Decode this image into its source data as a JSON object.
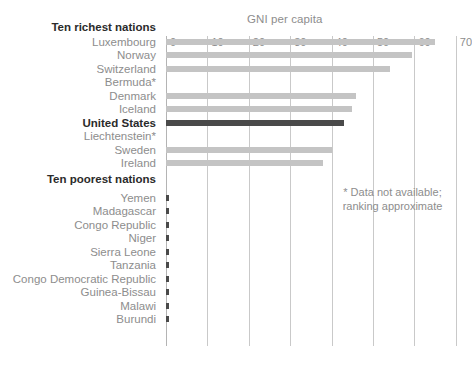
{
  "chart_data": {
    "type": "bar",
    "title": "GNI per capita",
    "xlabel": "",
    "ylabel": "",
    "orientation": "horizontal",
    "xlim": [
      0,
      70
    ],
    "xticks": [
      0,
      10,
      20,
      30,
      40,
      50,
      60,
      70
    ],
    "xtick_labels": [
      "0",
      "10",
      "20",
      "30",
      "40",
      "50",
      "60",
      "70"
    ],
    "grid": true,
    "legend": "none",
    "group_headings": [
      "Ten richest nations",
      "Ten poorest nations"
    ],
    "highlight_category": "United States",
    "annotation": "* Data not available; ranking approximate",
    "annotation_lines": [
      "* Data not available;",
      "ranking approximate"
    ],
    "categories": [
      "Luxembourg",
      "Norway",
      "Switzerland",
      "Bermuda*",
      "Denmark",
      "Iceland",
      "United States",
      "Liechtenstein*",
      "Sweden",
      "Ireland",
      "Yemen",
      "Madagascar",
      "Congo Republic",
      "Niger",
      "Sierra Leone",
      "Tanzania",
      "Congo Democratic Republic",
      "Guinea-Bissau",
      "Malawi",
      "Burundi"
    ],
    "values": [
      65,
      59.5,
      54,
      null,
      46,
      45,
      43,
      null,
      40,
      38,
      0.9,
      0.9,
      0.9,
      0.9,
      0.9,
      0.9,
      0.9,
      0.9,
      0.9,
      0.9
    ],
    "colors": {
      "bar": "#c4c4c4",
      "bar_highlight": "#4a4a4a",
      "bar_poorest": "#4a4a4a",
      "gridline": "#c9c9c9",
      "text": "#8d8d8d",
      "text_bold": "#2b2b2b"
    }
  },
  "groups": [
    {
      "heading": "Ten richest nations",
      "rows": [
        {
          "label": "Luxembourg",
          "value": 65,
          "style": "normal"
        },
        {
          "label": "Norway",
          "value": 59.5,
          "style": "normal"
        },
        {
          "label": "Switzerland",
          "value": 54,
          "style": "normal"
        },
        {
          "label": "Bermuda*",
          "value": null,
          "style": "normal"
        },
        {
          "label": "Denmark",
          "value": 46,
          "style": "normal"
        },
        {
          "label": "Iceland",
          "value": 45,
          "style": "normal"
        },
        {
          "label": "United States",
          "value": 43,
          "style": "highlight"
        },
        {
          "label": "Liechtenstein*",
          "value": null,
          "style": "normal"
        },
        {
          "label": "Sweden",
          "value": 40,
          "style": "normal"
        },
        {
          "label": "Ireland",
          "value": 38,
          "style": "normal"
        }
      ]
    },
    {
      "heading": "Ten poorest nations",
      "rows": [
        {
          "label": "Yemen",
          "value": 0.9,
          "style": "tiny"
        },
        {
          "label": "Madagascar",
          "value": 0.9,
          "style": "tiny"
        },
        {
          "label": "Congo Republic",
          "value": 0.9,
          "style": "tiny"
        },
        {
          "label": "Niger",
          "value": 0.9,
          "style": "tiny"
        },
        {
          "label": "Sierra Leone",
          "value": 0.9,
          "style": "tiny"
        },
        {
          "label": "Tanzania",
          "value": 0.9,
          "style": "tiny"
        },
        {
          "label": "Congo Democratic Republic",
          "value": 0.9,
          "style": "tiny"
        },
        {
          "label": "Guinea-Bissau",
          "value": 0.9,
          "style": "tiny"
        },
        {
          "label": "Malawi",
          "value": 0.9,
          "style": "tiny"
        },
        {
          "label": "Burundi",
          "value": 0.9,
          "style": "tiny"
        }
      ]
    }
  ]
}
